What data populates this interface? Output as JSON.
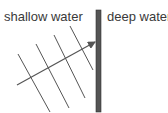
{
  "labels": {
    "shallow": "shallow water",
    "deep": "deep water"
  },
  "colors": {
    "lines": "#555555",
    "boundary": "#555555",
    "boundary_border": "#333333",
    "text": "#3a3a3a"
  },
  "diagram": {
    "boundary": {
      "x": 96,
      "y": 10,
      "width": 5,
      "height": 102
    },
    "wavefronts": [
      {
        "x1": 18,
        "y1": 54,
        "x2": 50,
        "y2": 112
      },
      {
        "x1": 36,
        "y1": 44,
        "x2": 69,
        "y2": 108
      },
      {
        "x1": 54,
        "y1": 35,
        "x2": 85,
        "y2": 98
      },
      {
        "x1": 70,
        "y1": 26,
        "x2": 93,
        "y2": 70
      }
    ],
    "ray": {
      "x1": 17,
      "y1": 85,
      "x2": 95,
      "y2": 42
    }
  }
}
